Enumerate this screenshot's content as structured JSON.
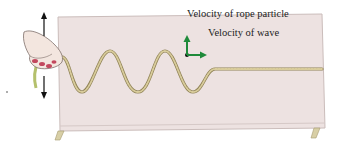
{
  "figure": {
    "labels": {
      "particle_velocity": "Velocity of rope particle",
      "wave_velocity": "Velocity of wave"
    },
    "annotations": {
      "hand_motion": "up-down double arrow beside hand",
      "stray_mark": "."
    }
  },
  "colors": {
    "table_top": "#ede2e1",
    "table_edge": "#cbbdbb",
    "rope": "#c9b98a",
    "rope_dark": "#8f8256",
    "vector": "#1f8a3a",
    "arrow": "#111111",
    "skin": "#f3e6df",
    "nails": "#c2485e"
  },
  "icons": {
    "hand": "hand-shaking-rope-icon",
    "particle_vector": "arrow-up-icon",
    "wave_vector": "arrow-right-icon",
    "motion_arrow": "double-arrow-vertical-icon"
  }
}
